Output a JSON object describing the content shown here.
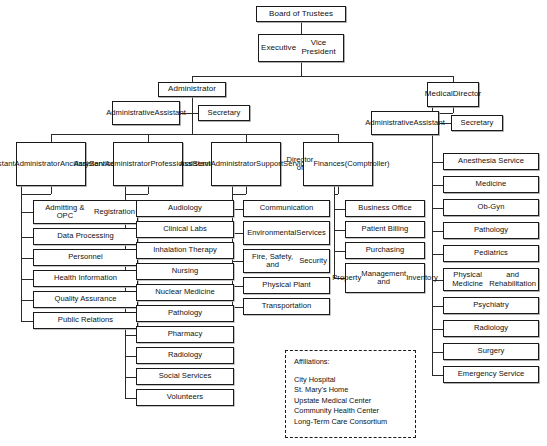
{
  "chart": {
    "type": "org-chart",
    "background": "#ffffff",
    "line_color": "#2a2a2a",
    "box_border_color": "#1a1a1a"
  },
  "top": {
    "board": "Board of Trustees",
    "exec_vp": "Executive\nVice President"
  },
  "administrator": {
    "title": "Administrator",
    "admin_assistant": "Administrative\nAssistant",
    "secretary": "Secretary"
  },
  "medical_director": {
    "title": "Medical\nDirector",
    "admin_assistant": "Administrative\nAssistant",
    "secretary": "Secretary"
  },
  "divisions": [
    {
      "id": "ancillary",
      "head": "Assistant\nAdministrator\nAncillary\nServices",
      "items": [
        "Admitting & OPC\nRegistration",
        "Data Processing",
        "Personnel",
        "Health Information",
        "Quality Assurance",
        "Public Relations"
      ]
    },
    {
      "id": "professional",
      "head": "Assistant\nAdministrator\nProfessional\nServices",
      "items": [
        "Audiology",
        "Clinical Labs",
        "Inhalation Therapy",
        "Nursing",
        "Nuclear Medicine",
        "Pathology",
        "Pharmacy",
        "Radiology",
        "Social Services",
        "Volunteers"
      ]
    },
    {
      "id": "support",
      "head": "Assistant\nAdministrator\nSupport\nServices",
      "items": [
        "Communication",
        "Environmental\nServices",
        "Fire, Safety, and\nSecurity",
        "Physical Plant",
        "Transportation"
      ]
    },
    {
      "id": "finances",
      "head": "Director of\nFinances\n(Comptroller)",
      "items": [
        "Business Office",
        "Patient Billing",
        "Purchasing",
        "Property\nManagement and\nInventory"
      ]
    }
  ],
  "medical_services": [
    "Anesthesia Service",
    "Medicine",
    "Ob-Gyn",
    "Pathology",
    "Pediatrics",
    "Physical Medicine\nand Rehabilitation",
    "Psychiatry",
    "Radiology",
    "Surgery",
    "Emergency Service"
  ],
  "affiliations": {
    "label": "Affiliations:",
    "items": [
      "City Hospital",
      "St. Mary's Home",
      "Upstate Medical Center",
      "Community Health Center",
      "Long-Term Care Consortium"
    ]
  }
}
